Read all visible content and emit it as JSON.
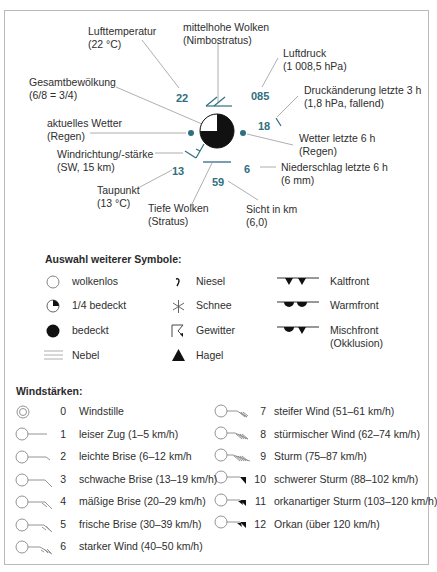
{
  "station_model": {
    "labels": {
      "air_temperature": {
        "title": "Lufttemperatur",
        "value": "(22 °C)"
      },
      "mid_clouds": {
        "title": "mittelhohe Wolken",
        "value": "(Nimbostratus)"
      },
      "air_pressure": {
        "title": "Luftdruck",
        "value": "(1 008,5 hPa)"
      },
      "pressure_change": {
        "title": "Druckänderung letzte 3 h",
        "value": "(1,8 hPa, fallend)"
      },
      "total_cloud_cover": {
        "title": "Gesamtbewölkung",
        "value": "(6/8 = 3/4)"
      },
      "current_weather": {
        "title": "aktuelles Wetter",
        "value": "(Regen)"
      },
      "weather_last_6h": {
        "title": "Wetter letzte 6 h",
        "value": "(Regen)"
      },
      "wind": {
        "title": "Windrichtung/-stärke",
        "value": "(SW, 15 km)"
      },
      "precip_last_6h": {
        "title": "Niederschlag letzte 6 h",
        "value": "(6 mm)"
      },
      "dew_point": {
        "title": "Taupunkt",
        "value": "(13 °C)"
      },
      "low_clouds": {
        "title": "Tiefe Wolken",
        "value": "(Stratus)"
      },
      "visibility": {
        "title": "Sicht in km",
        "value": "(6,0)"
      }
    },
    "numbers": {
      "temperature": "22",
      "pressure": "085",
      "pressure_change": "18",
      "dew_point": "13",
      "precipitation": "6",
      "visibility": "59"
    },
    "colors": {
      "accent": "#2f6f80",
      "line": "#9a9a9a",
      "symbol": "#111111"
    }
  },
  "symbols": {
    "heading": "Auswahl weiterer Symbole:",
    "col1": [
      {
        "icon": "circle-empty-icon",
        "label": "wolkenlos"
      },
      {
        "icon": "circle-quarter-icon",
        "label": "1/4 bedeckt"
      },
      {
        "icon": "circle-filled-icon",
        "label": "bedeckt"
      },
      {
        "icon": "fog-lines-icon",
        "label": "Nebel"
      }
    ],
    "col2": [
      {
        "icon": "drizzle-icon",
        "label": "Niesel"
      },
      {
        "icon": "snow-asterisk-icon",
        "label": "Schnee"
      },
      {
        "icon": "thunderstorm-icon",
        "label": "Gewitter"
      },
      {
        "icon": "hail-triangle-icon",
        "label": "Hagel"
      }
    ],
    "col3": [
      {
        "icon": "cold-front-icon",
        "label": "Kaltfront"
      },
      {
        "icon": "warm-front-icon",
        "label": "Warmfront"
      },
      {
        "icon": "occluded-front-icon",
        "label": "Mischfront",
        "label2": "(Okklusion)"
      }
    ]
  },
  "wind_scale": {
    "heading": "Windstärken:",
    "left": [
      {
        "bft": "0",
        "label": "Windstille"
      },
      {
        "bft": "1",
        "label": "leiser Zug (1–5 km/h)"
      },
      {
        "bft": "2",
        "label": "leichte Brise (6–12 km/h"
      },
      {
        "bft": "3",
        "label": "schwache Brise (13–19 km/h)"
      },
      {
        "bft": "4",
        "label": "mäßige Brise (20–29 km/h)"
      },
      {
        "bft": "5",
        "label": "frische Brise (30–39 km/h)"
      },
      {
        "bft": "6",
        "label": "starker Wind (40–50 km/h)"
      }
    ],
    "right": [
      {
        "bft": "7",
        "label": "steifer Wind (51–61 km/h)"
      },
      {
        "bft": "8",
        "label": "stürmischer Wind (62–74 km/h)"
      },
      {
        "bft": "9",
        "label": "Sturm (75–87 km/h)"
      },
      {
        "bft": "10",
        "label": "schwerer Sturm (88–102 km/h)"
      },
      {
        "bft": "11",
        "label": "orkanartiger Sturm (103–120 km/h)"
      },
      {
        "bft": "12",
        "label": "Orkan (über 120 km/h)"
      }
    ]
  }
}
